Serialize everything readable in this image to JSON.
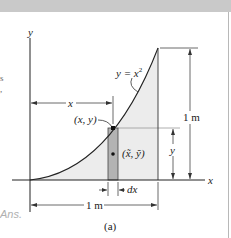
{
  "figure": {
    "caption": "(a)",
    "curve_label": "y = x",
    "curve_exponent": "2",
    "point_label": "(x, y)",
    "centroid_label": "(x̃, ỹ)",
    "axis_x": "x",
    "axis_y": "y",
    "dim_x": "x",
    "dim_y": "y",
    "dim_dx": "dx",
    "dim_width": "1 m",
    "dim_height": "1 m"
  },
  "margin_text": {
    "ans": "Ans.",
    "fragments": [
      "s",
      ","
    ]
  },
  "colors": {
    "shade": "#ececec",
    "strip": "#b3b3b3",
    "band": "#c9c9c9",
    "ink": "#222222"
  }
}
